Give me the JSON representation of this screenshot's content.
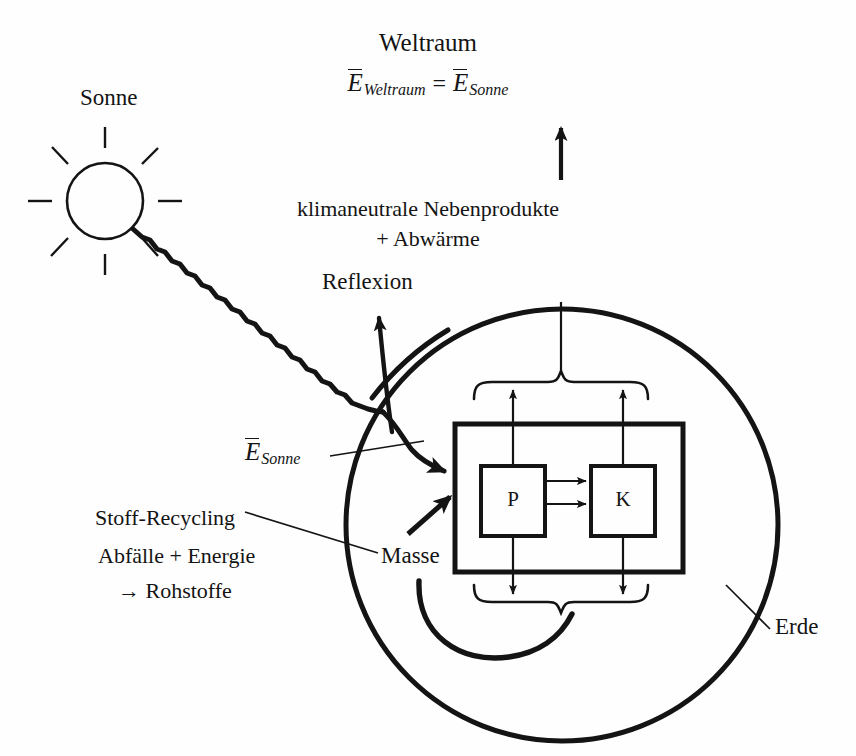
{
  "figure": {
    "type": "energy-flow-diagram",
    "language": "de",
    "ink_color": "#141414",
    "background_color": "#fefefe"
  },
  "space": {
    "title": "Weltraum",
    "formula": {
      "left_symbol": "E",
      "left_subscript": "Weltraum",
      "operator": "=",
      "right_symbol": "E",
      "right_subscript": "Sonne",
      "plain": "Ē Weltraum = Ē Sonne"
    },
    "outflow_line1": "klimaneutrale Nebenprodukte",
    "outflow_line2": "+ Abwärme"
  },
  "sun": {
    "label": "Sonne",
    "ray_label_symbol": "E",
    "ray_label_subscript": "Sonne",
    "reflection_label": "Reflexion"
  },
  "earth": {
    "label": "Erde",
    "mass_label": "Masse",
    "recycling": {
      "title": "Stoff-Recycling",
      "line1": "Abfälle + Energie",
      "line2": "→ Rohstoffe"
    },
    "system": {
      "boxes": [
        {
          "id": "P",
          "label": "P"
        },
        {
          "id": "K",
          "label": "K"
        }
      ]
    }
  }
}
